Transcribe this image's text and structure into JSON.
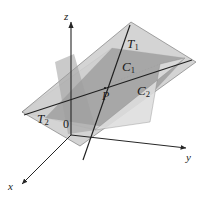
{
  "figure": {
    "kind": "3d-geometry-diagram",
    "background_color": "#ffffff",
    "line_color": "#262626",
    "label_color": "#1a1a1a"
  },
  "axes": {
    "z": {
      "label": "z",
      "sub": ""
    },
    "y": {
      "label": "y",
      "sub": ""
    },
    "x": {
      "label": "x",
      "sub": ""
    },
    "origin": {
      "label": "0"
    }
  },
  "labels": {
    "tangent_line_1": {
      "text": "T",
      "sub": "1"
    },
    "tangent_line_2": {
      "text": "T",
      "sub": "2"
    },
    "curve_1": {
      "text": "C",
      "sub": "1"
    },
    "curve_2": {
      "text": "C",
      "sub": "2"
    },
    "point_p": {
      "text": "P"
    }
  },
  "surfaces": {
    "tangent_plane": {
      "name": "tangent-plane",
      "fill": "#c9c9c9",
      "stroke": "#4a4a4a",
      "opacity": 0.85
    },
    "surface_plane": {
      "name": "surface-plane",
      "fill": "#d8d8d8",
      "stroke": "#5a5a5a",
      "opacity": 0.8
    },
    "overlap_region": {
      "name": "overlap-region",
      "fill": "#a6a6a6"
    }
  }
}
